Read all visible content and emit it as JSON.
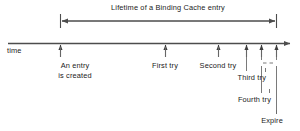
{
  "figure": {
    "type": "timeline-diagram",
    "width": 300,
    "height": 131,
    "background": "#ffffff",
    "line_color": "#4d4d4d",
    "text_color": "#1a1a1a"
  },
  "span": {
    "label": "Lifetime of a Binding Cache entry",
    "start_x": 60,
    "end_x": 276,
    "y": 21
  },
  "axis": {
    "label": "time",
    "y": 44,
    "start_x": 8,
    "end_x": 292
  },
  "events": [
    {
      "id": "entry-created",
      "label_line1": "An entry",
      "label_line2": "is created",
      "tick_x": 60,
      "label_x": 75,
      "label_y": 62
    },
    {
      "id": "first-try",
      "label_line1": "First try",
      "label_line2": "",
      "tick_x": 165,
      "label_x": 165,
      "label_y": 62
    },
    {
      "id": "second-try",
      "label_line1": "Second try",
      "label_line2": "",
      "tick_x": 218,
      "label_x": 218,
      "label_y": 62
    },
    {
      "id": "third-try",
      "label_line1": "Third try",
      "label_line2": "",
      "tick_x": 246,
      "label_x": 265,
      "label_y": 74
    },
    {
      "id": "fourth-try",
      "label_line1": "Fourth try",
      "label_line2": "",
      "tick_x": 261,
      "label_x": 270,
      "label_y": 96
    },
    {
      "id": "expire",
      "label_line1": "Expire",
      "label_line2": "",
      "tick_x": 276,
      "label_x": 282,
      "label_y": 117
    }
  ],
  "gap_marker": {
    "id": "retry-gap",
    "left_x": 261,
    "right_x": 276,
    "y": 63
  }
}
